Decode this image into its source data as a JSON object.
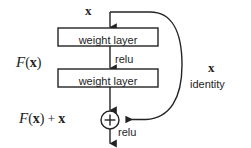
{
  "figure": {
    "type": "diagram",
    "background_color": "#ffffff",
    "stroke_color": "#232323",
    "text_color": "#232323"
  },
  "labels": {
    "input_top": "x",
    "weight_layer_1": "weight layer",
    "weight_layer_2": "weight layer",
    "relu_mid": "relu",
    "relu_bottom": "relu",
    "function_left_mathcal": "F",
    "function_left_paren_open": "(",
    "function_left_var": "x",
    "function_left_paren_close": ")",
    "output_mathcal": "F",
    "output_paren_open": "(",
    "output_var": "x",
    "output_paren_close": ")",
    "output_plus": "+",
    "output_addend": "x",
    "shortcut_var": "x",
    "shortcut_name": "identity",
    "adder_symbol": "+"
  },
  "nodes": {
    "weight_layer_1": {
      "x": 58,
      "y": 28,
      "w": 100,
      "h": 18
    },
    "weight_layer_2": {
      "x": 58,
      "y": 69,
      "w": 100,
      "h": 18
    },
    "adder": {
      "cx": 110,
      "cy": 120,
      "r": 9
    }
  },
  "edges": {
    "input_to_layer1": "x -> weight layer",
    "layer1_to_layer2": "relu",
    "layer2_to_adder": "F(x)",
    "shortcut": "identity skip connection from input to adder",
    "adder_to_output": "relu"
  }
}
